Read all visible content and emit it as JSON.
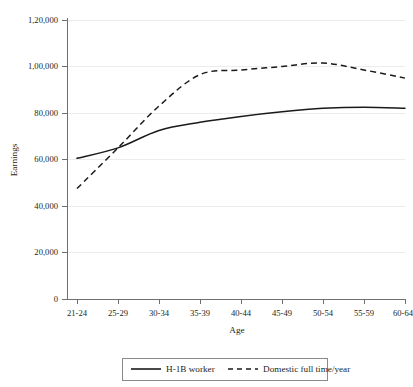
{
  "chart_data": {
    "type": "line",
    "title": "",
    "xlabel": "Age",
    "ylabel": "Earnings",
    "categories": [
      "21-24",
      "25-29",
      "30-34",
      "35-39",
      "40-44",
      "45-49",
      "50-54",
      "55-59",
      "60-64"
    ],
    "ylim": [
      0,
      120000
    ],
    "ytick_values": [
      0,
      20000,
      40000,
      60000,
      80000,
      100000,
      120000
    ],
    "ytick_labels": [
      "0",
      "20,000",
      "40,000",
      "60,000",
      "80,000",
      "1,00,000",
      "1,20,000"
    ],
    "grid": "horizontal-faint",
    "legend_position": "bottom-center",
    "series": [
      {
        "name": "H-1B worker",
        "style": "solid",
        "color": "#1a1a1a",
        "values": [
          60500,
          65000,
          72500,
          76000,
          78500,
          80500,
          82000,
          82500,
          82000
        ]
      },
      {
        "name": "Domestic full time/year",
        "style": "dashed",
        "color": "#1a1a1a",
        "values": [
          47500,
          65000,
          83000,
          96500,
          98500,
          100000,
          101500,
          98500,
          95000
        ]
      }
    ]
  },
  "axes": {
    "y_title": "Earnings",
    "x_title": "Age",
    "y_tick_labels": [
      "1,20,000",
      "1,00,000",
      "80,000",
      "60,000",
      "40,000",
      "20,000",
      "0"
    ],
    "x_tick_labels": [
      "21-24",
      "25-29",
      "30-34",
      "35-39",
      "40-44",
      "45-49",
      "50-54",
      "55-59",
      "60-64"
    ]
  },
  "legend": {
    "items": [
      {
        "label": "H-1B worker",
        "style": "solid"
      },
      {
        "label": "Domestic full time/year",
        "style": "dashed"
      }
    ]
  }
}
